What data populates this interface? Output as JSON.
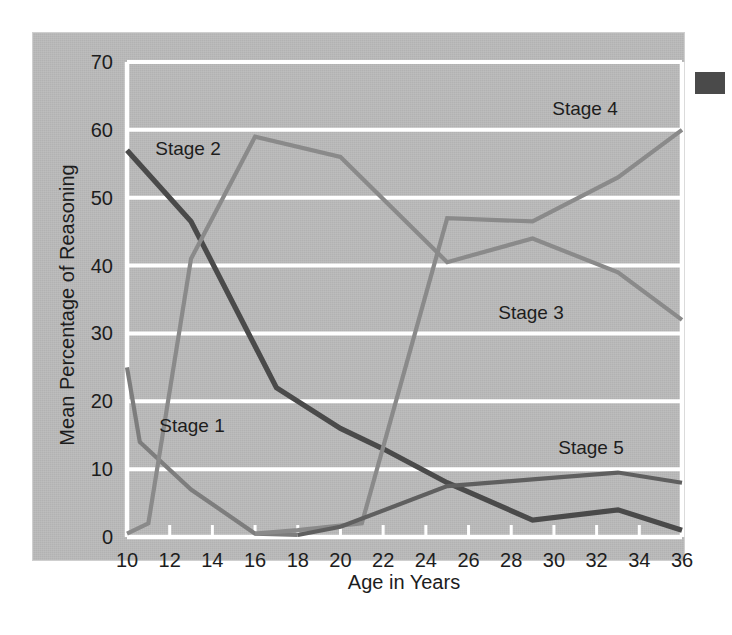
{
  "chart_data": {
    "type": "line",
    "title": "",
    "xlabel": "Age in Years",
    "ylabel": "Mean Percentage of Reasoning",
    "xlim": [
      10,
      36
    ],
    "ylim": [
      0,
      70
    ],
    "xticks": [
      10,
      12,
      14,
      16,
      18,
      20,
      22,
      24,
      26,
      28,
      30,
      32,
      34,
      36
    ],
    "yticks": [
      0,
      10,
      20,
      30,
      40,
      50,
      60,
      70
    ],
    "grid": true,
    "legend_position": "inline-annotations",
    "series": [
      {
        "name": "Stage 1",
        "color": "#7d7d7d",
        "x": [
          10,
          10.6,
          13,
          16,
          18
        ],
        "values": [
          25,
          14,
          7,
          0.5,
          0.3
        ]
      },
      {
        "name": "Stage 2",
        "color": "#4a4a4a",
        "x": [
          10,
          13,
          17,
          20,
          22,
          25,
          29,
          33,
          36
        ],
        "values": [
          57,
          46.5,
          22,
          16,
          13,
          8,
          2.5,
          4,
          1
        ]
      },
      {
        "name": "Stage 3",
        "color": "#8a8a8a",
        "x": [
          10,
          11,
          13,
          16,
          20,
          25,
          29,
          33,
          36
        ],
        "values": [
          0.5,
          2,
          41,
          59,
          56,
          40.5,
          44,
          39,
          32
        ]
      },
      {
        "name": "Stage 4",
        "color": "#8a8a8a",
        "x": [
          16,
          18,
          21,
          25,
          29,
          33,
          36
        ],
        "values": [
          0.5,
          1,
          2,
          47,
          46.5,
          53,
          60
        ]
      },
      {
        "name": "Stage 5",
        "color": "#5f5f5f",
        "x": [
          18,
          20,
          25,
          29,
          33,
          36
        ],
        "values": [
          0.3,
          1.5,
          7.5,
          8.5,
          9.5,
          8
        ]
      }
    ],
    "annotations": [
      {
        "text": "Stage 1",
        "x_px": 192,
        "y_px": 432
      },
      {
        "text": "Stage 2",
        "x_px": 188,
        "y_px": 155
      },
      {
        "text": "Stage 3",
        "x_px": 531,
        "y_px": 319
      },
      {
        "text": "Stage 4",
        "x_px": 585,
        "y_px": 115
      },
      {
        "text": "Stage 5",
        "x_px": 591,
        "y_px": 454
      }
    ]
  },
  "figure": {
    "corner_mark_color": "#4a4a4a",
    "panel_color": "#b9b9b9",
    "gridline_color": "#ffffff"
  }
}
